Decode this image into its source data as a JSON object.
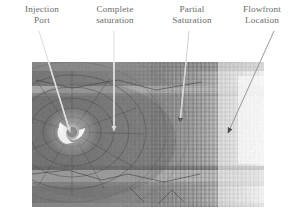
{
  "figure": {
    "caption_labels": [
      {
        "id": "injection-port",
        "line1": "Injection",
        "line2": "Port"
      },
      {
        "id": "complete-saturation",
        "line1": "Complete",
        "line2": "saturation"
      },
      {
        "id": "partial-saturation",
        "line1": "Partial",
        "line2": "Saturation"
      },
      {
        "id": "flowfront-location",
        "line1": "Flowfront",
        "line2": "Location"
      }
    ],
    "colors": {
      "label_text": "#6a6a6a",
      "leader_line": "#8a8a8a",
      "page_background": "#ffffff",
      "fabric_dark": "#6e6e6e",
      "fabric_mid": "#8d8d8d",
      "fabric_light": "#c9c9c9",
      "dry_region": "#f2f2f2",
      "injection_port_highlight": "#ffffff"
    },
    "photo": {
      "description": "Grayscale photograph of resin flow through a woven composite fabric",
      "regions": [
        {
          "name": "injection-port",
          "note": "bright white crescent at left of center"
        },
        {
          "name": "complete-saturation",
          "note": "uniform dark gray saturated fabric"
        },
        {
          "name": "partial-saturation",
          "note": "mottled mid-gray with visible weave mesh"
        },
        {
          "name": "flowfront-location",
          "note": "light edge where resin front terminates"
        },
        {
          "name": "dry-fabric",
          "note": "near-white unsaturated region at right"
        }
      ]
    }
  }
}
